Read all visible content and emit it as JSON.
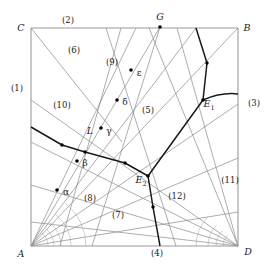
{
  "figure": {
    "kind": "geometric-diagram",
    "width": 272,
    "height": 273,
    "background_color": "#ffffff",
    "line_color_thin": "#8a8a8a",
    "line_color_bold": "#1a1a1a",
    "point_color": "#000000"
  },
  "vertices": [
    {
      "id": "C",
      "label": "C",
      "x": 31,
      "y": 28,
      "label_x": 21,
      "label_y": 28
    },
    {
      "id": "B",
      "label": "B",
      "x": 238,
      "y": 28,
      "label_x": 247,
      "label_y": 28
    },
    {
      "id": "A",
      "label": "A",
      "x": 31,
      "y": 246,
      "label_x": 21,
      "label_y": 254
    },
    {
      "id": "D",
      "label": "D",
      "x": 238,
      "y": 246,
      "label_x": 248,
      "label_y": 252
    }
  ],
  "points": [
    {
      "id": "G",
      "label": "G",
      "x": 160,
      "y": 27,
      "label_x": 160,
      "label_y": 17,
      "dot": true
    },
    {
      "id": "E1",
      "label": "E",
      "sub": "1",
      "x": 203,
      "y": 100,
      "label_x": 207,
      "label_y": 104,
      "dot": true
    },
    {
      "id": "E2",
      "label": "E",
      "sub": "2",
      "x": 148,
      "y": 176,
      "label_x": 140,
      "label_y": 180,
      "dot": true
    },
    {
      "id": "alpha",
      "label": "α",
      "x": 62,
      "y": 192,
      "dot_x": 57,
      "dot_y": 190,
      "label_x": 66,
      "label_y": 192,
      "dot": true
    },
    {
      "id": "beta",
      "label": "β",
      "x": 82,
      "y": 163,
      "dot_x": 77,
      "dot_y": 161,
      "label_x": 85,
      "label_y": 163,
      "dot": true
    },
    {
      "id": "gamma",
      "label": "γ",
      "x": 106,
      "y": 131,
      "dot_x": 101,
      "dot_y": 128,
      "label_x": 109,
      "label_y": 131,
      "dot": true
    },
    {
      "id": "delta",
      "label": "δ",
      "x": 122,
      "y": 102,
      "dot_x": 117,
      "dot_y": 100,
      "label_x": 125,
      "label_y": 102,
      "dot": true
    },
    {
      "id": "epsilon",
      "label": "ε",
      "x": 136,
      "y": 73,
      "dot_x": 131,
      "dot_y": 70,
      "label_x": 139,
      "label_y": 73,
      "dot": true
    }
  ],
  "curve_labels": [
    {
      "id": "L",
      "label": "L",
      "x": 90,
      "y": 131
    }
  ],
  "regions": [
    {
      "id": "r1",
      "label": "(1)",
      "x": 17,
      "y": 88
    },
    {
      "id": "r2",
      "label": "(2)",
      "x": 68,
      "y": 20
    },
    {
      "id": "r3",
      "label": "(3)",
      "x": 254,
      "y": 103
    },
    {
      "id": "r4",
      "label": "(4)",
      "x": 157,
      "y": 253
    },
    {
      "id": "r5",
      "label": "(5)",
      "x": 148,
      "y": 110
    },
    {
      "id": "r6",
      "label": "(6)",
      "x": 74,
      "y": 50
    },
    {
      "id": "r7",
      "label": "(7)",
      "x": 118,
      "y": 215
    },
    {
      "id": "r8",
      "label": "(8)",
      "x": 90,
      "y": 198
    },
    {
      "id": "r9",
      "label": "(9)",
      "x": 112,
      "y": 62
    },
    {
      "id": "r10",
      "label": "(10)",
      "x": 62,
      "y": 105
    },
    {
      "id": "r11",
      "label": "(11)",
      "x": 230,
      "y": 180
    },
    {
      "id": "r12",
      "label": "(12)",
      "x": 177,
      "y": 196
    }
  ],
  "frame": {
    "top": {
      "x1": 31,
      "y1": 28,
      "x2": 238,
      "y2": 28
    },
    "right": {
      "x1": 238,
      "y1": 28,
      "x2": 238,
      "y2": 246
    },
    "bottom": {
      "x1": 31,
      "y1": 246,
      "x2": 238,
      "y2": 246
    },
    "left": {
      "x1": 31,
      "y1": 28,
      "x2": 31,
      "y2": 246
    }
  },
  "thin_lines": [
    {
      "id": "C-to-bottomdiag",
      "x1": 31,
      "y1": 28,
      "x2": 122,
      "y2": 142
    },
    {
      "id": "A-fan-1",
      "x1": 31,
      "y1": 246,
      "x2": 136,
      "y2": 28
    },
    {
      "id": "A-fan-2",
      "x1": 31,
      "y1": 246,
      "x2": 160,
      "y2": 27
    },
    {
      "id": "A-fan-3",
      "x1": 31,
      "y1": 246,
      "x2": 196,
      "y2": 28
    },
    {
      "id": "A-fan-4",
      "x1": 31,
      "y1": 246,
      "x2": 238,
      "y2": 28
    },
    {
      "id": "A-fan-5",
      "x1": 31,
      "y1": 246,
      "x2": 238,
      "y2": 104
    },
    {
      "id": "A-fan-6",
      "x1": 31,
      "y1": 246,
      "x2": 238,
      "y2": 158
    },
    {
      "id": "A-fan-7",
      "x1": 31,
      "y1": 246,
      "x2": 238,
      "y2": 212
    },
    {
      "id": "D-fan-1",
      "x1": 238,
      "y1": 246,
      "x2": 31,
      "y2": 100
    },
    {
      "id": "D-fan-2",
      "x1": 238,
      "y1": 246,
      "x2": 31,
      "y2": 142
    },
    {
      "id": "D-fan-3",
      "x1": 238,
      "y1": 246,
      "x2": 31,
      "y2": 185
    },
    {
      "id": "D-fan-4",
      "x1": 238,
      "y1": 246,
      "x2": 31,
      "y2": 222
    },
    {
      "id": "D-fan-5",
      "x1": 238,
      "y1": 246,
      "x2": 149,
      "y2": 28
    },
    {
      "id": "D-fan-6",
      "x1": 238,
      "y1": 246,
      "x2": 177,
      "y2": 28
    },
    {
      "id": "G-down-left",
      "x1": 160,
      "y1": 27,
      "x2": 92,
      "y2": 246
    },
    {
      "id": "top-steep-1",
      "x1": 106,
      "y1": 28,
      "x2": 176,
      "y2": 246
    },
    {
      "id": "top-steep-2",
      "x1": 121,
      "y1": 28,
      "x2": 60,
      "y2": 246
    }
  ],
  "bold_polyline_L": {
    "id": "L-polyline",
    "points": "31,127 62,145 85,152 125,163 148,176",
    "nodes": [
      {
        "x": 62,
        "y": 145
      },
      {
        "x": 85,
        "y": 152
      },
      {
        "x": 125,
        "y": 163
      }
    ]
  },
  "bold_polyline_E": {
    "id": "E-polyline",
    "points": "196,28 207,63 203,100 148,176",
    "nodes": [
      {
        "x": 207,
        "y": 63
      }
    ]
  },
  "bold_segment_E2_down": {
    "id": "E2-down",
    "points": "148,176 153,207 160,246",
    "nodes": [
      {
        "x": 153,
        "y": 207
      }
    ]
  },
  "bold_curve_E1_B": {
    "id": "E1-to-right-edge",
    "path": "M 203,100 Q 222,92 238,94"
  },
  "angle_arcs_A": [
    {
      "id": "arc-a1",
      "r": 17
    },
    {
      "id": "arc-a2",
      "r": 23
    },
    {
      "id": "arc-a3",
      "r": 30
    },
    {
      "id": "arc-a4",
      "r": 40
    },
    {
      "id": "arc-a5",
      "r": 55
    }
  ],
  "angle_arcs_D": [
    {
      "id": "arc-d1",
      "r": 15
    },
    {
      "id": "arc-d2",
      "r": 22
    },
    {
      "id": "arc-d3",
      "r": 30
    },
    {
      "id": "arc-d4",
      "r": 42
    }
  ]
}
